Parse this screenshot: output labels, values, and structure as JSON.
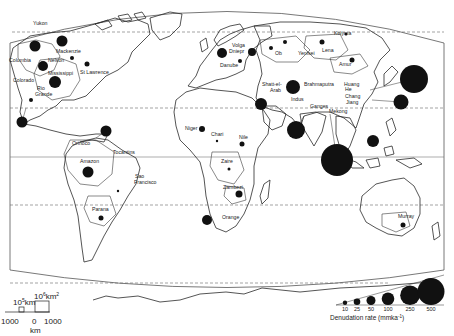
{
  "map": {
    "title": "World drainage basins - mechanical denudation rates",
    "projection_frame": "elliptical world projection",
    "grid": {
      "latitude_lines": [
        "dashed 60N",
        "dashed 30N",
        "solid equator",
        "dashed 30S",
        "dashed 60S"
      ]
    }
  },
  "basins": [
    {
      "name": "Yukon",
      "x": 35,
      "y": 46,
      "r": 5.5,
      "rate_class": 100
    },
    {
      "name": "Mackenzie",
      "x": 62,
      "y": 41,
      "r": 5.5,
      "rate_class": 100
    },
    {
      "name": "Columbia",
      "x": 36,
      "y": 46,
      "r": 0,
      "rate_class": null
    },
    {
      "name": "Nelson",
      "x": 43,
      "y": 66,
      "r": 5,
      "rate_class": 50
    },
    {
      "name": "Mississippi",
      "x": 55,
      "y": 82,
      "r": 6,
      "rate_class": 100
    },
    {
      "name": "St Lawrence",
      "x": 87,
      "y": 64,
      "r": 2.5,
      "rate_class": 25
    },
    {
      "name": "Colorado",
      "x": 31,
      "y": 99,
      "r": 0,
      "rate_class": null
    },
    {
      "name": "Rio Grande",
      "x": 31,
      "y": 100,
      "r": 2,
      "rate_class": 10
    },
    {
      "name": "Hudson region",
      "x": 72,
      "y": 58,
      "r": 2,
      "rate_class": 10
    },
    {
      "name": "Central America",
      "x": 22,
      "y": 122,
      "r": 5.5,
      "rate_class": 100
    },
    {
      "name": "Magdalena",
      "x": 106,
      "y": 131,
      "r": 5.5,
      "rate_class": 100
    },
    {
      "name": "Orinoco",
      "x": 79,
      "y": 142,
      "r": 0,
      "rate_class": null
    },
    {
      "name": "Amazon",
      "x": 88,
      "y": 172,
      "r": 5.5,
      "rate_class": 100
    },
    {
      "name": "Tocantins",
      "x": 118,
      "y": 154,
      "r": 0,
      "rate_class": null
    },
    {
      "name": "Sao Francisco",
      "x": 118,
      "y": 191,
      "r": 1.2,
      "rate_class": 10
    },
    {
      "name": "Parana",
      "x": 101,
      "y": 218,
      "r": 2.5,
      "rate_class": 25
    },
    {
      "name": "Niger",
      "x": 202,
      "y": 129,
      "r": 3,
      "rate_class": 25
    },
    {
      "name": "Chari",
      "x": 217,
      "y": 141,
      "r": 1.2,
      "rate_class": 10
    },
    {
      "name": "Nile",
      "x": 242,
      "y": 144,
      "r": 2.5,
      "rate_class": 25
    },
    {
      "name": "Zaire",
      "x": 229,
      "y": 169,
      "r": 1.5,
      "rate_class": 10
    },
    {
      "name": "Zambezi",
      "x": 239,
      "y": 194,
      "r": 3.5,
      "rate_class": 50
    },
    {
      "name": "Orange",
      "x": 207,
      "y": 220,
      "r": 5,
      "rate_class": 50
    },
    {
      "name": "Rhine",
      "x": 222,
      "y": 53,
      "r": 5,
      "rate_class": 50
    },
    {
      "name": "Danube",
      "x": 240,
      "y": 61,
      "r": 2,
      "rate_class": 10
    },
    {
      "name": "Volga",
      "x": 242,
      "y": 52,
      "r": 0,
      "rate_class": null
    },
    {
      "name": "Dniepr",
      "x": 242,
      "y": 53,
      "r": 0,
      "rate_class": null
    },
    {
      "name": "Don",
      "x": 252,
      "y": 52,
      "r": 4,
      "rate_class": 50
    },
    {
      "name": "Ob",
      "x": 271,
      "y": 48,
      "r": 2,
      "rate_class": 10
    },
    {
      "name": "Yenisei",
      "x": 285,
      "y": 42,
      "r": 2,
      "rate_class": 10
    },
    {
      "name": "Lena",
      "x": 322,
      "y": 42,
      "r": 2.5,
      "rate_class": 25
    },
    {
      "name": "Kolyma",
      "x": 346,
      "y": 34,
      "r": 1.5,
      "rate_class": 10
    },
    {
      "name": "Amur",
      "x": 352,
      "y": 60,
      "r": 2.5,
      "rate_class": 25
    },
    {
      "name": "Shatt-el-Arab",
      "x": 293,
      "y": 87,
      "r": 7,
      "rate_class": 250
    },
    {
      "name": "Arabian",
      "x": 261,
      "y": 104,
      "r": 6,
      "rate_class": 100
    },
    {
      "name": "Brahmaputra",
      "x": 297,
      "y": 86,
      "r": 0,
      "rate_class": null
    },
    {
      "name": "Indus",
      "x": 296,
      "y": 130,
      "r": 9,
      "rate_class": 250
    },
    {
      "name": "Ganges",
      "x": 337,
      "y": 160,
      "r": 16,
      "rate_class": 500
    },
    {
      "name": "Huang He",
      "x": 414,
      "y": 79,
      "r": 14,
      "rate_class": 500
    },
    {
      "name": "Chang Jiang",
      "x": 401,
      "y": 102,
      "r": 7.5,
      "rate_class": 250
    },
    {
      "name": "Mekong",
      "x": 373,
      "y": 141,
      "r": 6,
      "rate_class": 100
    },
    {
      "name": "Murray",
      "x": 403,
      "y": 225,
      "r": 2.5,
      "rate_class": 25
    }
  ],
  "labels": [
    {
      "text": "Yukon",
      "x": 33,
      "y": 25
    },
    {
      "text": "Mackenzie",
      "x": 56,
      "y": 53
    },
    {
      "text": "Columbia",
      "x": 9,
      "y": 62
    },
    {
      "text": "Nelson",
      "x": 48,
      "y": 62
    },
    {
      "text": "Mississippi",
      "x": 48,
      "y": 75
    },
    {
      "text": "St Lawrence",
      "x": 80,
      "y": 74
    },
    {
      "text": "Colorado",
      "x": 13,
      "y": 82
    },
    {
      "text": "Rio",
      "x": 37,
      "y": 90
    },
    {
      "text": "Grande",
      "x": 35,
      "y": 96
    },
    {
      "text": "Orinoco",
      "x": 72,
      "y": 145
    },
    {
      "text": "Amazon",
      "x": 80,
      "y": 163
    },
    {
      "text": "Tocantins",
      "x": 113,
      "y": 154
    },
    {
      "text": "Sao",
      "x": 135,
      "y": 178
    },
    {
      "text": "Francisco",
      "x": 134,
      "y": 184
    },
    {
      "text": "Parana",
      "x": 92,
      "y": 211
    },
    {
      "text": "Niger",
      "x": 185,
      "y": 130
    },
    {
      "text": "Chari",
      "x": 211,
      "y": 136
    },
    {
      "text": "Nile",
      "x": 239,
      "y": 139
    },
    {
      "text": "Zaire",
      "x": 221,
      "y": 163
    },
    {
      "text": "Zambezi",
      "x": 223,
      "y": 189
    },
    {
      "text": "Orange",
      "x": 222,
      "y": 219
    },
    {
      "text": "Volga",
      "x": 232,
      "y": 47
    },
    {
      "text": "Dniepr",
      "x": 229,
      "y": 53
    },
    {
      "text": "Danube",
      "x": 220,
      "y": 67
    },
    {
      "text": "Ob",
      "x": 275,
      "y": 55
    },
    {
      "text": "Yenisei",
      "x": 298,
      "y": 55
    },
    {
      "text": "Kolyma",
      "x": 334,
      "y": 35
    },
    {
      "text": "Lena",
      "x": 322,
      "y": 52
    },
    {
      "text": "Amur",
      "x": 339,
      "y": 66
    },
    {
      "text": "Shatt-el-",
      "x": 262,
      "y": 86
    },
    {
      "text": "Arab",
      "x": 270,
      "y": 92
    },
    {
      "text": "Brahmaputra",
      "x": 304,
      "y": 86
    },
    {
      "text": "Huang",
      "x": 344,
      "y": 86
    },
    {
      "text": "He",
      "x": 345,
      "y": 91
    },
    {
      "text": "Indus",
      "x": 291,
      "y": 101
    },
    {
      "text": "Chang",
      "x": 345,
      "y": 98
    },
    {
      "text": "Jiang",
      "x": 346,
      "y": 104
    },
    {
      "text": "Ganges",
      "x": 310,
      "y": 108
    },
    {
      "text": "Mekong",
      "x": 329,
      "y": 113
    },
    {
      "text": "Murray",
      "x": 398,
      "y": 218
    }
  ],
  "legend": {
    "title": "Denudation rate (mmka",
    "title_sup": "-1",
    "title_close": ")",
    "classes": [
      {
        "value": "10",
        "r": 2.2
      },
      {
        "value": "25",
        "r": 3.3
      },
      {
        "value": "50",
        "r": 4.5
      },
      {
        "value": "100",
        "r": 6.3
      },
      {
        "value": "250",
        "r": 9.8
      },
      {
        "value": "500",
        "r": 13.5
      }
    ]
  },
  "scale": {
    "small_area_label": "10",
    "small_area_exp": "5",
    "small_area_unit": "km",
    "small_area_unit_exp": "2",
    "large_area_label": "10",
    "large_area_exp": "6",
    "large_area_unit": "km",
    "large_area_unit_exp": "2",
    "distance_ticks": [
      "1000",
      "0",
      "1000"
    ],
    "distance_unit": "km"
  }
}
